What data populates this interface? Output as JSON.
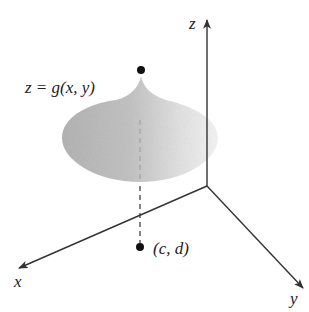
{
  "figure": {
    "type": "3d-surface-diagram",
    "axes": {
      "x_label": "x",
      "y_label": "y",
      "z_label": "z"
    },
    "surface_label": "z = g(x, y)",
    "point_label": "(c, d)",
    "colors": {
      "axis": "#333333",
      "surface_dark": "#b8b8b8",
      "surface_light": "#f2f2f2",
      "point": "#111111",
      "text": "#222222"
    }
  }
}
